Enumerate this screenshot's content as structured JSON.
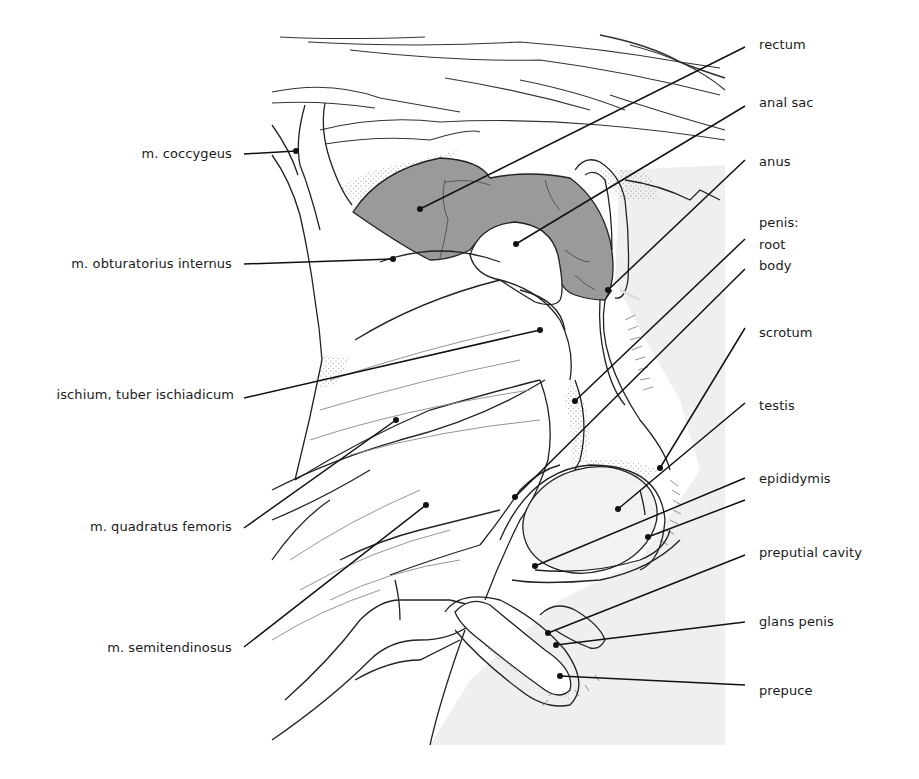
{
  "figure": {
    "colors": {
      "background": "#ffffff",
      "skin_shade": "#eeeeee",
      "rectum_fill": "#9a9a9a",
      "line": "#1a1a1a",
      "thin_line": "#555555"
    }
  },
  "labels_left": [
    {
      "id": "coccygeus",
      "text": "m. coccygeus"
    },
    {
      "id": "obturatorius",
      "text": "m. obturatorius internus"
    },
    {
      "id": "ischium",
      "text": "ischium, tuber ischiadicum"
    },
    {
      "id": "quadratus",
      "text": "m. quadratus femoris"
    },
    {
      "id": "semitendinosus",
      "text": "m. semitendinosus"
    }
  ],
  "labels_right": [
    {
      "id": "rectum",
      "text": "rectum"
    },
    {
      "id": "anal_sac",
      "text": "anal sac"
    },
    {
      "id": "anus",
      "text": "anus"
    },
    {
      "id": "penis",
      "text": "penis:"
    },
    {
      "id": "root",
      "text": "root"
    },
    {
      "id": "body",
      "text": "body"
    },
    {
      "id": "scrotum",
      "text": "scrotum"
    },
    {
      "id": "testis",
      "text": "testis"
    },
    {
      "id": "epididymis",
      "text": "epididymis"
    },
    {
      "id": "preputial_cavity",
      "text": "preputial cavity"
    },
    {
      "id": "glans_penis",
      "text": "glans penis"
    },
    {
      "id": "prepuce",
      "text": "prepuce"
    }
  ]
}
